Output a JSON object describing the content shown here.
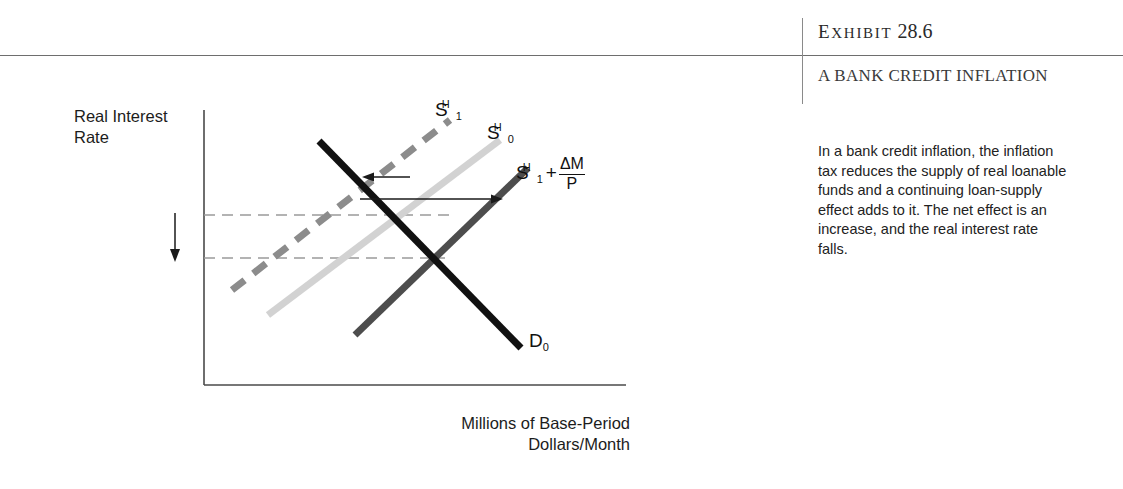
{
  "exhibit": {
    "label_prefix": "Exhibit",
    "label_letters": [
      "E",
      "X",
      "H",
      "I",
      "B",
      "I",
      "T"
    ],
    "number": "28.6",
    "title": "A BANK CREDIT INFLATION",
    "caption": "In a bank credit inflation, the inflation tax reduces the supply of real loanable funds and a continuing loan-supply effect adds to it. The net effect is an increase, and the real interest rate falls."
  },
  "figure": {
    "y_axis_label": "Real Interest Rate",
    "x_axis_label": "Millions of Base-Period Dollars/Month",
    "curve_labels": {
      "s1h": {
        "base": "S",
        "sub": "1",
        "sup": "H"
      },
      "s0h": {
        "base": "S",
        "sub": "0",
        "sup": "H"
      },
      "s1h_plus": {
        "base": "S",
        "sub": "1",
        "sup": "H",
        "operator": "+",
        "fraction_num": "ΔM",
        "fraction_den": "P"
      },
      "d0": {
        "base": "D",
        "sub": "0"
      }
    },
    "colors": {
      "axis": "#4a4a4a",
      "demand_curve": "#111111",
      "supply_s0h": "#cfcfcf",
      "supply_s1h_dashed": "#8c8c8c",
      "supply_s1h_plus": "#4d4d4d",
      "dashed_guide": "#9a9a9a",
      "arrow": "#1a1a1a",
      "rule": "#6e6e6e"
    },
    "annotations": {
      "leftward_shift_arrow": "leftward shift arrow",
      "rightward_shift_arrow": "rightward shift arrow",
      "rate_fall_arrow": "downward real interest rate arrow"
    }
  },
  "chart_data": {
    "type": "line",
    "title": "A Bank Credit Inflation",
    "xlabel": "Millions of Base-Period Dollars/Month",
    "ylabel": "Real Interest Rate",
    "grid": false,
    "legend": "inline curve labels",
    "axis_ranges": {
      "x": [
        0,
        100
      ],
      "y": [
        0,
        100
      ]
    },
    "series": [
      {
        "name": "D0",
        "label": "D₀",
        "style": "solid",
        "color": "#111111",
        "points": [
          [
            28,
            84
          ],
          [
            72,
            24
          ]
        ],
        "description": "Demand for loanable funds, downward sloping"
      },
      {
        "name": "S0H",
        "label": "S₀ᴴ",
        "style": "solid",
        "color": "#cfcfcf",
        "points": [
          [
            18,
            20
          ],
          [
            66,
            84
          ]
        ],
        "description": "Original real loanable funds supply"
      },
      {
        "name": "S1H",
        "label": "S₁ᴴ",
        "style": "dashed",
        "color": "#8c8c8c",
        "points": [
          [
            8,
            26
          ],
          [
            52,
            88
          ]
        ],
        "description": "Supply after inflation tax reduces real loanable funds (leftward shift)"
      },
      {
        "name": "S1H_plus_dM_over_P",
        "label": "S₁ᴴ + ΔM/P",
        "style": "solid",
        "color": "#4d4d4d",
        "points": [
          [
            38,
            8
          ],
          [
            84,
            66
          ]
        ],
        "description": "Supply including continuing loan-supply effect (rightward shift); net increase"
      }
    ],
    "guide_lines": [
      {
        "type": "horizontal-dashed",
        "y": 66,
        "from_x": 0,
        "to_x": 66,
        "description": "higher real interest rate level"
      },
      {
        "type": "horizontal-dashed",
        "y": 48,
        "from_x": 0,
        "to_x": 72,
        "description": "lower real interest rate level after net increase in supply"
      }
    ],
    "annotations": [
      {
        "type": "arrow",
        "direction": "left",
        "description": "inflation tax shifts supply left"
      },
      {
        "type": "arrow",
        "direction": "right",
        "description": "continuing loan-supply effect shifts supply right"
      },
      {
        "type": "arrow",
        "direction": "down",
        "description": "real interest rate falls"
      }
    ]
  }
}
